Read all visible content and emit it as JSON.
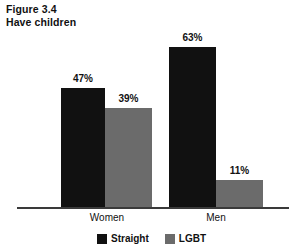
{
  "figure": {
    "number_line": "Figure 3.4",
    "title_line": "Have children"
  },
  "chart_data": {
    "type": "bar",
    "title": "Have children",
    "subtitle": "Figure 3.4",
    "categories": [
      "Women",
      "Men"
    ],
    "series": [
      {
        "name": "Straight",
        "color": "#111111",
        "values": [
          47,
          39
        ]
      },
      {
        "name": "LGBT",
        "color": "#6b6b6b",
        "values": [
          63,
          11
        ]
      }
    ],
    "series_correct": [
      {
        "name": "Straight",
        "color": "#111111",
        "values": [
          47,
          63
        ]
      },
      {
        "name": "LGBT",
        "color": "#6b6b6b",
        "values": [
          39,
          11
        ]
      }
    ],
    "data_labels": [
      "47%",
      "39%",
      "63%",
      "11%"
    ],
    "value_unit": "%",
    "ylim": [
      0,
      100
    ],
    "grid": false,
    "legend_position": "bottom",
    "xlabel": "",
    "ylabel": "",
    "axis_visible": {
      "x": true,
      "y": false
    }
  },
  "bars": [
    {
      "id": "women-straight",
      "group": "Women",
      "series": "Straight",
      "label": "47%",
      "value": 47,
      "color": "#111111",
      "x": 61,
      "width": 44
    },
    {
      "id": "women-lgbt",
      "group": "Women",
      "series": "LGBT",
      "label": "39%",
      "value": 39,
      "color": "#6b6b6b",
      "x": 105,
      "width": 47
    },
    {
      "id": "men-straight",
      "group": "Men",
      "series": "Straight",
      "label": "63%",
      "value": 63,
      "color": "#111111",
      "x": 169,
      "width": 47
    },
    {
      "id": "men-lgbt",
      "group": "Men",
      "series": "LGBT",
      "label": "11%",
      "value": 11,
      "color": "#6b6b6b",
      "x": 216,
      "width": 47
    }
  ],
  "category_labels": [
    {
      "text": "Women",
      "center": 107
    },
    {
      "text": "Men",
      "center": 216
    }
  ],
  "legend": {
    "items": [
      {
        "label": "Straight",
        "color": "#111111"
      },
      {
        "label": "LGBT",
        "color": "#6b6b6b"
      }
    ]
  }
}
